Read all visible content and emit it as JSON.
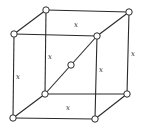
{
  "diagram": {
    "type": "crystal-lattice-cube",
    "colors": {
      "line": "#2a2a2a",
      "atom_fill": "#ffffff",
      "background": "#ffffff"
    },
    "vertices": {
      "btl": [
        46,
        10
      ],
      "btr": [
        129,
        12
      ],
      "ftl": [
        14,
        34
      ],
      "ftr": [
        97,
        36
      ],
      "bbl": [
        45,
        94
      ],
      "bbr": [
        127,
        94
      ],
      "fbl": [
        13,
        118
      ],
      "fbr": [
        95,
        119
      ],
      "center": [
        71,
        65
      ]
    },
    "edge_labels": [
      {
        "id": "top-back",
        "text": "x"
      },
      {
        "id": "back-left-vertical",
        "text": "x"
      },
      {
        "id": "right-back-vertical",
        "text": "x"
      },
      {
        "id": "front-right-vertical",
        "text": "x"
      },
      {
        "id": "front-left-vertical",
        "text": "x"
      },
      {
        "id": "bottom",
        "text": "x"
      }
    ]
  }
}
